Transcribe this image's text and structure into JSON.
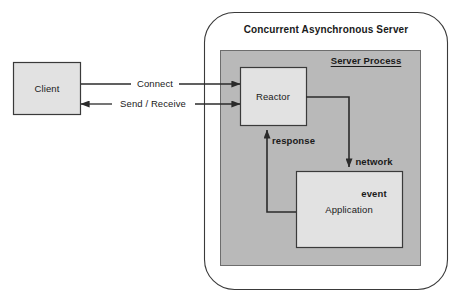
{
  "diagram": {
    "title": "Concurrent Asynchronous Server",
    "colors": {
      "page_background": "#ffffff",
      "server_process_fill": "#b9b9b9",
      "component_fill": "#e2e2e2",
      "stroke": "#2b2b2b",
      "text": "#1a1a1a"
    },
    "boundary": {
      "name": "concurrent-asynchronous-server-boundary",
      "shape": "rounded-rectangle",
      "fill": "none"
    },
    "nodes": [
      {
        "id": "client",
        "label": "Client",
        "shape": "rectangle",
        "fill": "#e2e2e2"
      },
      {
        "id": "server-process",
        "label": "Server Process",
        "shape": "rectangle",
        "fill": "#b9b9b9",
        "label_style": "bold-underline"
      },
      {
        "id": "reactor",
        "label": "Reactor",
        "shape": "rectangle",
        "fill": "#e2e2e2"
      },
      {
        "id": "application",
        "label": "Application",
        "shape": "rectangle",
        "fill": "#e2e2e2"
      }
    ],
    "edges": [
      {
        "id": "connect",
        "label": "Connect",
        "from": "client",
        "to": "reactor",
        "direction": "forward"
      },
      {
        "id": "send-receive",
        "label": "Send / Receive",
        "from": "client",
        "to": "reactor",
        "direction": "bidirectional"
      },
      {
        "id": "network-event",
        "label_line1": "network",
        "label_line2": "event",
        "from": "reactor",
        "to": "application",
        "direction": "forward"
      },
      {
        "id": "response",
        "label": "response",
        "from": "application",
        "to": "reactor",
        "direction": "forward"
      }
    ]
  }
}
